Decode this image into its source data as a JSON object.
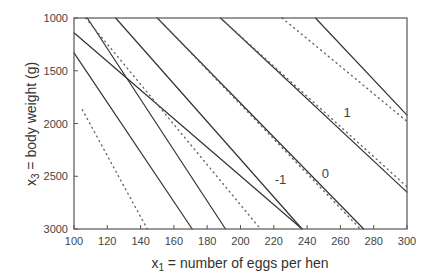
{
  "chart_data": {
    "type": "line",
    "title": "",
    "xlabel": "x1 = number of eggs per hen",
    "xlabel_main": "x",
    "xlabel_sub": "1",
    "xlabel_rest": " = number of eggs per hen",
    "ylabel": "x3 = body weight (g)",
    "ylabel_main": "x",
    "ylabel_sub": "3",
    "ylabel_rest": " = body weight (g)",
    "xlim": [
      100,
      300
    ],
    "ylim": [
      3000,
      1000
    ],
    "y_inverted": true,
    "grid": false,
    "x_ticks": [
      100,
      120,
      140,
      160,
      180,
      200,
      220,
      240,
      260,
      280,
      300
    ],
    "y_ticks": [
      1000,
      1500,
      2000,
      2500,
      3000
    ],
    "annotations": [
      {
        "text": "1",
        "x": 264,
        "y": 1940
      },
      {
        "text": "0",
        "x": 251,
        "y": 2520
      },
      {
        "text": "-1",
        "x": 224,
        "y": 2570
      }
    ],
    "series": [
      {
        "name": "contour solid A",
        "style": "solid",
        "points": [
          [
            107,
            1140
          ],
          [
            100,
            1140
          ],
          [
            100,
            1140
          ],
          [
            237,
            3000
          ]
        ],
        "x": [
          100,
          237
        ],
        "y": [
          1140,
          3000
        ]
      },
      {
        "name": "contour solid B",
        "style": "solid",
        "x": [
          100,
          171
        ],
        "y": [
          1330,
          3000
        ]
      },
      {
        "name": "contour solid C",
        "style": "solid",
        "x": [
          108,
          191
        ],
        "y": [
          1000,
          3000
        ]
      },
      {
        "name": "contour solid -1",
        "style": "solid",
        "x": [
          125,
          237
        ],
        "y": [
          1000,
          3000
        ]
      },
      {
        "name": "contour solid 0",
        "style": "solid",
        "x": [
          150,
          274
        ],
        "y": [
          1000,
          3000
        ]
      },
      {
        "name": "contour solid 1",
        "style": "solid",
        "x": [
          188,
          300
        ],
        "y": [
          1000,
          2650
        ]
      },
      {
        "name": "contour solid top",
        "style": "solid",
        "x": [
          245,
          300
        ],
        "y": [
          1000,
          1920
        ]
      },
      {
        "name": "contour dotted A",
        "style": "dotted",
        "x": [
          105,
          144
        ],
        "y": [
          1870,
          3000
        ]
      },
      {
        "name": "contour dotted B",
        "style": "dotted",
        "x": [
          107,
          212
        ],
        "y": [
          1000,
          3000
        ]
      },
      {
        "name": "contour dotted 0",
        "style": "dotted",
        "x": [
          150,
          272
        ],
        "y": [
          1000,
          3000
        ]
      },
      {
        "name": "contour dotted 1",
        "style": "dotted",
        "x": [
          188,
          300
        ],
        "y": [
          1000,
          2600
        ]
      },
      {
        "name": "contour dotted top",
        "style": "dotted",
        "x": [
          225,
          300
        ],
        "y": [
          1000,
          1980
        ]
      }
    ]
  },
  "colors": {
    "axis": "#555555",
    "line": "#333333",
    "dotted": "#666666"
  }
}
